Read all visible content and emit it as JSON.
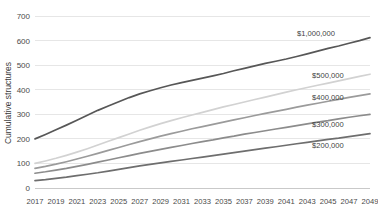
{
  "chart_data": {
    "type": "line",
    "title": "",
    "xlabel": "",
    "ylabel": "Cumulative structures",
    "ylim": [
      0,
      700
    ],
    "ytick_labels": [
      "0",
      "100",
      "200",
      "300",
      "400",
      "500",
      "600",
      "700"
    ],
    "ytick_values": [
      0,
      100,
      200,
      300,
      400,
      500,
      600,
      700
    ],
    "grid": true,
    "grid_axis": "y",
    "legend_position": "inline-right-of-lines",
    "x": [
      2017,
      2018,
      2019,
      2020,
      2021,
      2022,
      2023,
      2024,
      2025,
      2026,
      2027,
      2028,
      2029,
      2030,
      2031,
      2032,
      2033,
      2034,
      2035,
      2036,
      2037,
      2038,
      2039,
      2040,
      2041,
      2042,
      2043,
      2044,
      2045,
      2046,
      2047,
      2048,
      2049
    ],
    "xtick_labels": [
      "2017",
      "2019",
      "2021",
      "2023",
      "2025",
      "2027",
      "2029",
      "2031",
      "2033",
      "2035",
      "2037",
      "2039",
      "2041",
      "2043",
      "2045",
      "2047",
      "2049"
    ],
    "xtick_values": [
      2017,
      2019,
      2021,
      2023,
      2025,
      2027,
      2029,
      2031,
      2033,
      2035,
      2037,
      2039,
      2041,
      2043,
      2045,
      2047,
      2049
    ],
    "series": [
      {
        "name": "$1,000,000",
        "color": "#575757",
        "values": [
          200,
          218,
          237,
          256,
          276,
          296,
          316,
          334,
          351,
          368,
          383,
          396,
          408,
          419,
          429,
          438,
          447,
          456,
          466,
          477,
          487,
          497,
          507,
          516,
          525,
          535,
          546,
          557,
          568,
          578,
          589,
          600,
          612
        ]
      },
      {
        "name": "$500,000",
        "color": "#d2d2d2",
        "values": [
          100,
          110,
          121,
          133,
          146,
          160,
          175,
          190,
          205,
          220,
          235,
          249,
          262,
          274,
          286,
          297,
          308,
          319,
          330,
          340,
          350,
          360,
          370,
          380,
          390,
          400,
          409,
          418,
          427,
          436,
          445,
          454,
          463
        ]
      },
      {
        "name": "$400,000",
        "color": "#9b9b9b",
        "values": [
          80,
          88,
          97,
          107,
          118,
          129,
          141,
          153,
          165,
          177,
          189,
          200,
          211,
          221,
          231,
          241,
          250,
          259,
          268,
          277,
          286,
          295,
          304,
          312,
          320,
          329,
          337,
          345,
          353,
          361,
          369,
          376,
          383
        ]
      },
      {
        "name": "$300,000",
        "color": "#8c8c8c",
        "values": [
          60,
          66,
          73,
          80,
          88,
          96,
          105,
          114,
          123,
          132,
          141,
          149,
          157,
          165,
          173,
          181,
          189,
          196,
          204,
          211,
          219,
          226,
          233,
          240,
          247,
          254,
          261,
          268,
          274,
          281,
          288,
          294,
          300
        ]
      },
      {
        "name": "$200,000",
        "color": "#6e6e6e",
        "values": [
          30,
          34,
          39,
          44,
          50,
          56,
          62,
          69,
          76,
          83,
          90,
          96,
          102,
          108,
          114,
          120,
          126,
          132,
          138,
          144,
          150,
          156,
          162,
          168,
          174,
          180,
          186,
          192,
          198,
          203,
          209,
          215,
          221
        ]
      }
    ],
    "series_label_anchors": [
      {
        "name": "$1,000,000",
        "x_px": 297,
        "y_px": 36
      },
      {
        "name": "$500,000",
        "x_px": 312,
        "y_px": 78
      },
      {
        "name": "$400,000",
        "x_px": 312,
        "y_px": 100
      },
      {
        "name": "$300,000",
        "x_px": 312,
        "y_px": 127
      },
      {
        "name": "$200,000",
        "x_px": 312,
        "y_px": 148
      }
    ],
    "colors": {
      "grid": "#e6e6e6",
      "axis": "#c9c9c9",
      "text": "#4a4a4a",
      "background": "#ffffff"
    }
  }
}
